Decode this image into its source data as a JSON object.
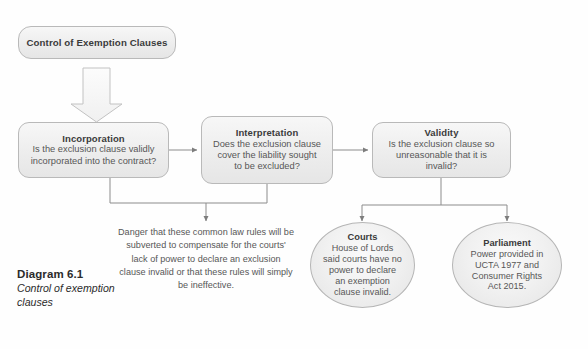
{
  "diagram": {
    "root": {
      "label": "Control of Exemption Clauses"
    },
    "stages": [
      {
        "title": "Incorporation",
        "question_line1": "Is the exclusion clause validly",
        "question_line2": "incorporated into the contract?"
      },
      {
        "title": "Interpretation",
        "question_line1": "Does the exclusion clause",
        "question_line2": "cover the liability sought",
        "question_line3": "to be excluded?"
      },
      {
        "title": "Validity",
        "question_line1": "Is the exclusion clause so",
        "question_line2": "unreasonable that it is invalid?"
      }
    ],
    "danger_note": "Danger that these common law rules will be subverted to compensate for the courts' lack of power to declare an exclusion clause invalid or that these rules will simply be ineffective.",
    "outcomes": [
      {
        "title": "Courts",
        "body": "House of Lords said courts have no power to declare an exemption clause invalid."
      },
      {
        "title": "Parliament",
        "body": "Power provided in UCTA 1977 and Consumer Rights Act 2015."
      }
    ]
  },
  "caption": {
    "number": "Diagram 6.1",
    "description": "Control of exemption clauses"
  },
  "colors": {
    "box_border": "#b9b9b9",
    "box_fill": "#eeeeee",
    "connector": "#8c8c8c",
    "text": "#575757",
    "title_text": "#3b3b3b"
  }
}
